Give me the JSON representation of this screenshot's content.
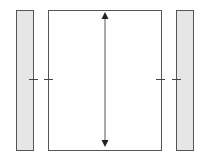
{
  "diagram": {
    "elements": {
      "left_bar": {
        "fill": "#e6e6e6",
        "stroke": "#555555",
        "pattern": "stippled"
      },
      "center_box": {
        "fill": "#ffffff",
        "stroke": "#555555"
      },
      "right_bar": {
        "fill": "#e6e6e6",
        "stroke": "#555555",
        "pattern": "stippled"
      },
      "vertical_arrow": {
        "type": "double-headed",
        "orientation": "vertical",
        "color": "#333333"
      },
      "tick_marks": {
        "count": 4,
        "position": "mid-height",
        "color": "#444444"
      }
    },
    "labels": []
  }
}
